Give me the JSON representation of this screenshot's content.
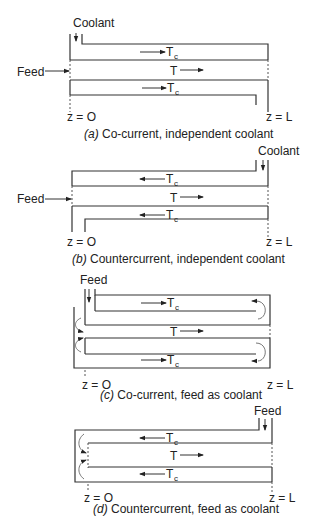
{
  "figure": {
    "panels": [
      {
        "id": "a",
        "caption_letter": "(a)",
        "caption_text": " Co-current, independent coolant",
        "inlet_label": "Coolant",
        "feed_label": "Feed",
        "z_start": "z = O",
        "z_end": "z = L",
        "top_coolant": "T",
        "top_coolant_sub": "c",
        "reactor": "T",
        "bottom_coolant": "T",
        "bottom_coolant_sub": "c",
        "coolant_direction": "right",
        "reactor_direction": "right"
      },
      {
        "id": "b",
        "caption_letter": "(b)",
        "caption_text": " Countercurrent, independent coolant",
        "inlet_label": "Coolant",
        "feed_label": "Feed",
        "z_start": "z = O",
        "z_end": "z = L",
        "top_coolant": "T",
        "top_coolant_sub": "c",
        "reactor": "T",
        "bottom_coolant": "T",
        "bottom_coolant_sub": "c",
        "coolant_direction": "left",
        "reactor_direction": "right"
      },
      {
        "id": "c",
        "caption_letter": "(c)",
        "caption_text": " Co-current, feed as coolant",
        "inlet_label": "Feed",
        "z_start": "z = O",
        "z_end": "z = L",
        "top_coolant": "T",
        "top_coolant_sub": "c",
        "reactor": "T",
        "bottom_coolant": "T",
        "bottom_coolant_sub": "c",
        "coolant_direction": "right",
        "reactor_direction": "right"
      },
      {
        "id": "d",
        "caption_letter": "(d)",
        "caption_text": " Countercurrent, feed as coolant",
        "inlet_label": "Feed",
        "z_start": "z = O",
        "z_end": "z = L",
        "top_coolant": "T",
        "top_coolant_sub": "c",
        "reactor": "T",
        "bottom_coolant": "T",
        "bottom_coolant_sub": "c",
        "coolant_direction": "left",
        "reactor_direction": "right"
      }
    ]
  }
}
